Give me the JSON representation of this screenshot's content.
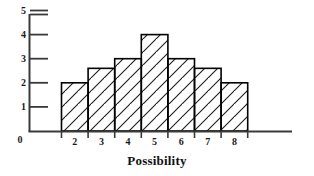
{
  "chart_data": {
    "type": "bar",
    "title": "",
    "subtitle": "",
    "xlabel": "Possibility",
    "ylabel": "",
    "categories": [
      "2",
      "3",
      "4",
      "5",
      "6",
      "7",
      "8"
    ],
    "values": [
      2,
      2.6,
      3,
      4,
      3,
      2.6,
      2
    ],
    "series": [
      {
        "name": "Frequency",
        "values": [
          2,
          2.6,
          3,
          4,
          3,
          2.6,
          2
        ]
      }
    ],
    "xlim": [
      1.5,
      8.5
    ],
    "ylim": [
      0,
      5.2
    ],
    "y_ticks": [
      1,
      2,
      3,
      4,
      5
    ],
    "y_tick_labels": [
      "1",
      "2",
      "3",
      "4",
      "5"
    ],
    "x_tick_labels": [
      "2",
      "3",
      "4",
      "5",
      "6",
      "7",
      "8"
    ],
    "origin_label": "0",
    "grid": false,
    "legend": false,
    "legend_position": "none",
    "bar_fill": "#ffffff",
    "bar_stroke": "#000000",
    "hatch": "diagonal-up",
    "hatch_color": "#1a1a1a",
    "axis_color": "#3a3a3a",
    "background": "#ffffff",
    "annotations": []
  },
  "axis": {
    "x_title": "Possibility",
    "origin": "0"
  }
}
